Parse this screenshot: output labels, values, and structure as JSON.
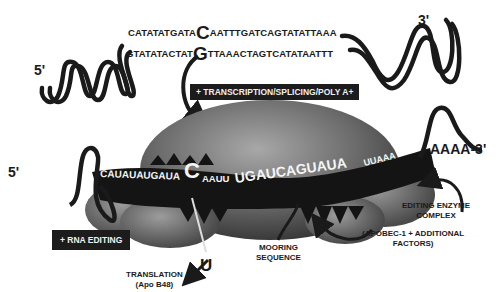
{
  "dna": {
    "top_strand": {
      "prefix": "CATATATGATA",
      "highlight": "C",
      "suffix": "AATTTGATCAGTATATTAAA"
    },
    "bottom_strand": {
      "prefix": "GTATATACTAT",
      "highlight": "G",
      "suffix": "TTAAACTAGTCATATAATTT"
    },
    "five_prime": "5'",
    "three_prime": "3'"
  },
  "steps": {
    "transcription": "+ TRANSCRIPTION/SPLICING/POLY A+",
    "rna_editing": "+ RNA EDITING"
  },
  "mrna": {
    "five_prime": "5'",
    "three_prime": "AAAA-3'",
    "seq_part1": "CAUAUAUGAUA",
    "edited_base": "C",
    "seq_part2": "AAUU",
    "mooring": "UGAUCAGUAUA",
    "seq_part3": "UUAAA"
  },
  "edit_result": "U",
  "labels": {
    "translation_line1": "TRANSLATION",
    "translation_line2": "(Apo B48)",
    "mooring_line1": "MOORING",
    "mooring_line2": "SEQUENCE",
    "enzyme_line1": "EDITING ENZYME",
    "enzyme_line2": "COMPLEX",
    "factors_line1": "(APOBEC-1 + ADDITIONAL",
    "factors_line2": "FACTORS)"
  },
  "colors": {
    "ink": "#1a1a1a",
    "blob_dark": "#4a4a4a",
    "blob_light": "#9a9a9a",
    "background": "#ffffff"
  }
}
